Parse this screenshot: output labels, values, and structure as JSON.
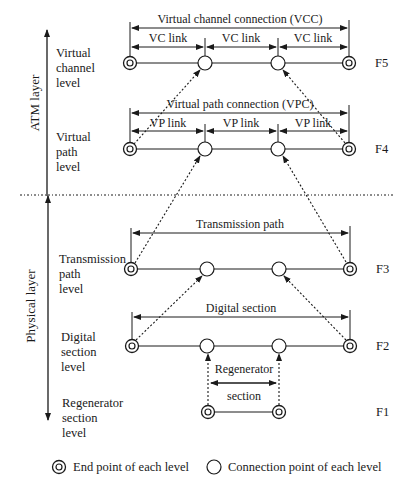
{
  "layers": {
    "atm": "ATM layer",
    "physical": "Physical layer"
  },
  "levels": [
    {
      "id": "F5",
      "label": "Virtual\nchannel\nlevel",
      "flow": "F5"
    },
    {
      "id": "F4",
      "label": "Virtual\npath\nlevel",
      "flow": "F4"
    },
    {
      "id": "F3",
      "label": "Transmission\npath\nlevel",
      "flow": "F3"
    },
    {
      "id": "F2",
      "label": "Digital\nsection\nlevel",
      "flow": "F2"
    },
    {
      "id": "F1",
      "label": "Regenerator\nsection\nlevel",
      "flow": "F1"
    }
  ],
  "spans": {
    "vcc": "Virtual channel connection (VCC)",
    "vc_link": "VC link",
    "vpc": "Virtual path connection (VPC)",
    "vp_link": "VP link",
    "transmission_path": "Transmission path",
    "digital_section": "Digital section",
    "regenerator": "Regenerator",
    "section": "section"
  },
  "legend": {
    "end_point": "End point of each level",
    "connection_point": "Connection point of each level"
  },
  "colors": {
    "line": "#1a1a1a",
    "background": "#ffffff"
  }
}
